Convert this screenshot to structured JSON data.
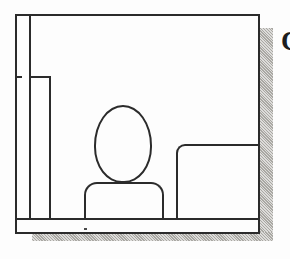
{
  "figure": {
    "caption_fragment": "C",
    "ink_color": "#2b2b2b",
    "shadow_color": "#b4b2ad",
    "paper_color": "#fdfdfd"
  },
  "elements": {
    "room_frame": "Outer room rectangle",
    "partition_wall": "Interior partition wall at left",
    "wall_tick": "Short wall tick mark",
    "floor_line": "Floor baseline",
    "person_head": "Oval head of seated figure",
    "person_body": "Shoulders and torso of seated figure",
    "counter": "Counter / desk unit at right",
    "drop_shadow_right": "Hatched drop shadow, right side",
    "drop_shadow_bottom": "Hatched drop shadow, bottom side",
    "floor_speck": "Scan speck on floor"
  }
}
